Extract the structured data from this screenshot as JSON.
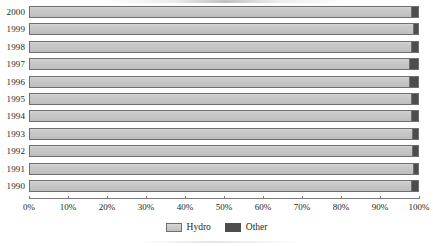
{
  "chart_data": {
    "type": "bar",
    "orientation": "horizontal",
    "stacked": true,
    "normalized": "100%",
    "title": "",
    "xlabel": "",
    "ylabel": "",
    "xlim": [
      0,
      100
    ],
    "grid": false,
    "legend_position": "bottom-center",
    "categories": [
      "2000",
      "1999",
      "1998",
      "1997",
      "1996",
      "1995",
      "1994",
      "1993",
      "1992",
      "1991",
      "1990"
    ],
    "tick_labels": [
      "0%",
      "10%",
      "20%",
      "30%",
      "40%",
      "50%",
      "60%",
      "70%",
      "80%",
      "90%",
      "100%"
    ],
    "tick_values": [
      0,
      10,
      20,
      30,
      40,
      50,
      60,
      70,
      80,
      90,
      100
    ],
    "series": [
      {
        "name": "Hydro",
        "color": "#c9c9c9",
        "values": [
          98.2,
          98.7,
          98.3,
          97.8,
          97.6,
          98.3,
          98.1,
          98.5,
          98.4,
          98.8,
          98.3
        ]
      },
      {
        "name": "Other",
        "color": "#4d4d4d",
        "values": [
          1.8,
          1.3,
          1.7,
          2.2,
          2.4,
          1.7,
          1.9,
          1.5,
          1.6,
          1.2,
          1.7
        ]
      }
    ]
  },
  "legend": {
    "items": [
      {
        "label": "Hydro",
        "swatch": "hydro"
      },
      {
        "label": "Other",
        "swatch": "other"
      }
    ]
  }
}
